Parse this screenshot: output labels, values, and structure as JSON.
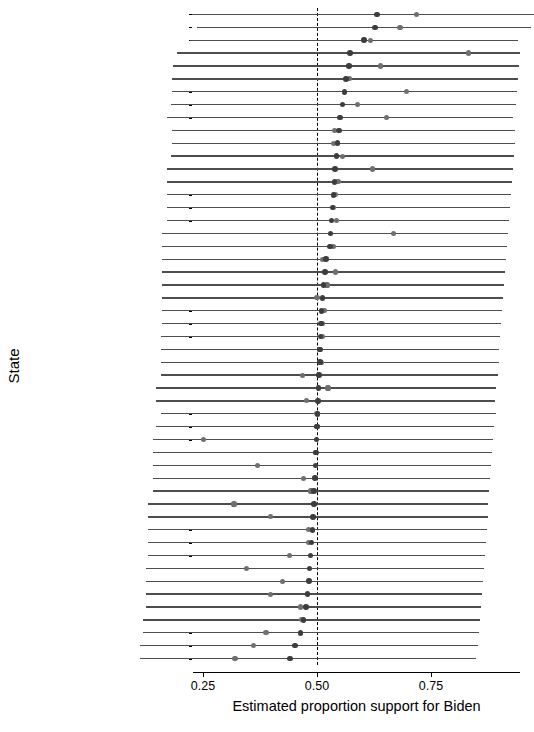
{
  "chart_data": {
    "type": "scatter",
    "title": "",
    "xlabel": "Estimated proportion support for Biden",
    "ylabel": "State",
    "xlim": [
      0.11,
      0.97
    ],
    "xticks": [
      0.25,
      0.5,
      0.75
    ],
    "xticklabels": [
      "0.25",
      "0.50",
      "0.75"
    ],
    "grid": false,
    "legend": "none",
    "reference_line": {
      "x": 0.5,
      "style": "dashed",
      "color": "#000000"
    },
    "series": [
      {
        "name": "estimate-dark",
        "color": "#3d3d3d",
        "marker": "circle"
      },
      {
        "name": "estimate-light",
        "color": "#6f6f6f",
        "marker": "circle"
      },
      {
        "name": "interval",
        "color": "#4d4d4d",
        "marker": "errorbar-horizontal"
      }
    ],
    "categories": [
      "connecticut",
      "massachusetts",
      "california",
      "vermont",
      "district of columbia",
      "virginia",
      "new mexico",
      "maryland",
      "hawaii",
      "new york",
      "michigan",
      "wisconsin",
      "delaware",
      "washington",
      "illinois",
      "oregon",
      "new jersey",
      "rhode island",
      "maine",
      "new hampshire",
      "north carolina",
      "ohio",
      "wyoming",
      "florida",
      "iowa",
      "minnesota",
      "missouri",
      "georgia",
      "montana",
      "mississippi",
      "nebraska",
      "nevada",
      "colorado",
      "north dakota",
      "louisiana",
      "south dakota",
      "indiana",
      "arizona",
      "alaska",
      "kansas",
      "kentucky",
      "alabama",
      "utah",
      "idaho",
      "oklahoma",
      "west virginia",
      "pennsylvania",
      "texas",
      "tennessee",
      "south carolina",
      "arkansas"
    ],
    "rows": [
      {
        "state": "connecticut",
        "low": 0.225,
        "high": 0.975,
        "dark": 0.632,
        "light": 0.718
      },
      {
        "state": "massachusetts",
        "low": 0.237,
        "high": 0.97,
        "dark": 0.627,
        "light": 0.682
      },
      {
        "state": "california",
        "low": 0.222,
        "high": 0.94,
        "dark": 0.603,
        "light": 0.617
      },
      {
        "state": "vermont",
        "low": 0.194,
        "high": 0.945,
        "dark": 0.572,
        "light": 0.833
      },
      {
        "state": "district of columbia",
        "low": 0.184,
        "high": 0.942,
        "dark": 0.57,
        "light": 0.64
      },
      {
        "state": "virginia",
        "low": 0.182,
        "high": 0.94,
        "dark": 0.564,
        "light": 0.572
      },
      {
        "state": "new mexico",
        "low": 0.182,
        "high": 0.938,
        "dark": 0.56,
        "light": 0.696
      },
      {
        "state": "maryland",
        "low": 0.18,
        "high": 0.936,
        "dark": 0.556,
        "light": 0.588
      },
      {
        "state": "hawaii",
        "low": 0.172,
        "high": 0.93,
        "dark": 0.55,
        "light": 0.653
      },
      {
        "state": "new york",
        "low": 0.182,
        "high": 0.935,
        "dark": 0.548,
        "light": 0.538
      },
      {
        "state": "michigan",
        "low": 0.182,
        "high": 0.934,
        "dark": 0.545,
        "light": 0.536
      },
      {
        "state": "wisconsin",
        "low": 0.18,
        "high": 0.932,
        "dark": 0.543,
        "light": 0.556
      },
      {
        "state": "delaware",
        "low": 0.172,
        "high": 0.93,
        "dark": 0.54,
        "light": 0.622
      },
      {
        "state": "washington",
        "low": 0.172,
        "high": 0.928,
        "dark": 0.538,
        "light": 0.546
      },
      {
        "state": "illinois",
        "low": 0.172,
        "high": 0.926,
        "dark": 0.536,
        "light": 0.54
      },
      {
        "state": "oregon",
        "low": 0.172,
        "high": 0.924,
        "dark": 0.534,
        "light": 0.536
      },
      {
        "state": "new jersey",
        "low": 0.172,
        "high": 0.922,
        "dark": 0.532,
        "light": 0.542
      },
      {
        "state": "rhode island",
        "low": 0.16,
        "high": 0.918,
        "dark": 0.53,
        "light": 0.668
      },
      {
        "state": "maine",
        "low": 0.16,
        "high": 0.916,
        "dark": 0.528,
        "light": 0.536
      },
      {
        "state": "new hampshire",
        "low": 0.16,
        "high": 0.914,
        "dark": 0.52,
        "light": 0.512
      },
      {
        "state": "north carolina",
        "low": 0.16,
        "high": 0.912,
        "dark": 0.517,
        "light": 0.54
      },
      {
        "state": "ohio",
        "low": 0.16,
        "high": 0.91,
        "dark": 0.514,
        "light": 0.522
      },
      {
        "state": "wyoming",
        "low": 0.16,
        "high": 0.908,
        "dark": 0.512,
        "light": 0.5
      },
      {
        "state": "florida",
        "low": 0.16,
        "high": 0.906,
        "dark": 0.51,
        "light": 0.516
      },
      {
        "state": "iowa",
        "low": 0.16,
        "high": 0.904,
        "dark": 0.509,
        "light": 0.511
      },
      {
        "state": "minnesota",
        "low": 0.158,
        "high": 0.902,
        "dark": 0.508,
        "light": 0.512
      },
      {
        "state": "missouri",
        "low": 0.158,
        "high": 0.9,
        "dark": 0.507,
        "light": 0.505
      },
      {
        "state": "georgia",
        "low": 0.158,
        "high": 0.898,
        "dark": 0.506,
        "light": 0.51
      },
      {
        "state": "montana",
        "low": 0.158,
        "high": 0.896,
        "dark": 0.504,
        "light": 0.468
      },
      {
        "state": "mississippi",
        "low": 0.146,
        "high": 0.893,
        "dark": 0.503,
        "light": 0.524
      },
      {
        "state": "nebraska",
        "low": 0.146,
        "high": 0.89,
        "dark": 0.502,
        "light": 0.477
      },
      {
        "state": "nevada",
        "low": 0.158,
        "high": 0.892,
        "dark": 0.501,
        "light": 0.5
      },
      {
        "state": "colorado",
        "low": 0.146,
        "high": 0.888,
        "dark": 0.5,
        "light": 0.5
      },
      {
        "state": "north dakota",
        "low": 0.14,
        "high": 0.886,
        "dark": 0.499,
        "light": 0.252
      },
      {
        "state": "louisiana",
        "low": 0.14,
        "high": 0.884,
        "dark": 0.498,
        "light": 0.497
      },
      {
        "state": "south dakota",
        "low": 0.14,
        "high": 0.882,
        "dark": 0.497,
        "light": 0.37
      },
      {
        "state": "indiana",
        "low": 0.14,
        "high": 0.88,
        "dark": 0.495,
        "light": 0.47
      },
      {
        "state": "arizona",
        "low": 0.14,
        "high": 0.878,
        "dark": 0.494,
        "light": 0.487
      },
      {
        "state": "alaska",
        "low": 0.13,
        "high": 0.876,
        "dark": 0.493,
        "light": 0.318
      },
      {
        "state": "kansas",
        "low": 0.13,
        "high": 0.874,
        "dark": 0.491,
        "light": 0.398
      },
      {
        "state": "kentucky",
        "low": 0.13,
        "high": 0.872,
        "dark": 0.49,
        "light": 0.482
      },
      {
        "state": "alabama",
        "low": 0.13,
        "high": 0.87,
        "dark": 0.488,
        "light": 0.482
      },
      {
        "state": "utah",
        "low": 0.13,
        "high": 0.868,
        "dark": 0.486,
        "light": 0.44
      },
      {
        "state": "idaho",
        "low": 0.124,
        "high": 0.866,
        "dark": 0.484,
        "light": 0.345
      },
      {
        "state": "oklahoma",
        "low": 0.124,
        "high": 0.864,
        "dark": 0.482,
        "light": 0.424
      },
      {
        "state": "west virginia",
        "low": 0.124,
        "high": 0.862,
        "dark": 0.479,
        "light": 0.398
      },
      {
        "state": "pennsylvania",
        "low": 0.124,
        "high": 0.86,
        "dark": 0.476,
        "light": 0.463
      },
      {
        "state": "texas",
        "low": 0.118,
        "high": 0.858,
        "dark": 0.47,
        "light": 0.466
      },
      {
        "state": "tennessee",
        "low": 0.118,
        "high": 0.855,
        "dark": 0.464,
        "light": 0.388
      },
      {
        "state": "south carolina",
        "low": 0.112,
        "high": 0.852,
        "dark": 0.452,
        "light": 0.36
      },
      {
        "state": "arkansas",
        "low": 0.112,
        "high": 0.848,
        "dark": 0.441,
        "light": 0.32
      }
    ]
  }
}
